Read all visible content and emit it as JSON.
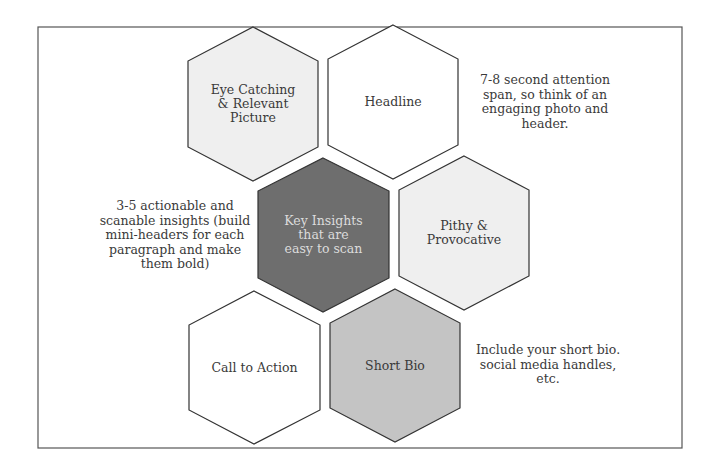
{
  "diagram": {
    "colors": {
      "frame": "#555555",
      "hex_stroke": "#333333",
      "light_fill": "#efefef",
      "white_fill": "#ffffff",
      "dark_fill": "#6e6e6e",
      "medium_fill": "#c4c4c4",
      "text": "#3a3a3a",
      "dark_text": "#dcdcdc"
    },
    "hexagons": [
      {
        "id": "eye-catching",
        "label": "Eye Catching & Relevant Picture",
        "lines": [
          "Eye Catching",
          "& Relevant",
          "Picture"
        ],
        "fill": "light"
      },
      {
        "id": "headline",
        "label": "Headline",
        "lines": [
          "Headline"
        ],
        "fill": "white"
      },
      {
        "id": "key-insights",
        "label": "Key Insights that are easy to scan",
        "lines": [
          "Key Insights",
          "that are",
          "easy to scan"
        ],
        "fill": "dark"
      },
      {
        "id": "pithy",
        "label": "Pithy & Provocative",
        "lines": [
          "Pithy &",
          "Provocative"
        ],
        "fill": "light"
      },
      {
        "id": "call-to-action",
        "label": "Call to Action",
        "lines": [
          "Call to Action"
        ],
        "fill": "white"
      },
      {
        "id": "short-bio",
        "label": "Short Bio",
        "lines": [
          "Short Bio"
        ],
        "fill": "medium"
      }
    ],
    "notes": [
      {
        "id": "attention-note",
        "lines": [
          "7-8 second attention",
          "span, so think of an",
          "engaging photo and",
          "header."
        ]
      },
      {
        "id": "insights-note",
        "lines": [
          "3-5 actionable and",
          "scanable insights (build",
          "mini-headers for each",
          "paragraph and make",
          "them bold)"
        ]
      },
      {
        "id": "bio-note",
        "lines": [
          "Include your short bio.",
          "social media handles,",
          "etc."
        ]
      }
    ]
  }
}
